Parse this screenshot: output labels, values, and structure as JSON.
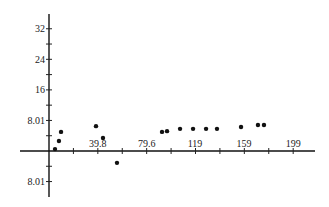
{
  "chart_data": {
    "type": "scatter",
    "title": "",
    "xlabel": "",
    "ylabel": "",
    "x_ticks": [
      39.8,
      79.6,
      119,
      159,
      199
    ],
    "y_ticks": [
      {
        "value": 32,
        "label": "32"
      },
      {
        "value": 24,
        "label": "24"
      },
      {
        "value": 16,
        "label": "16"
      },
      {
        "value": 8.01,
        "label": "8.01"
      },
      {
        "value": -8.01,
        "label": "8.01"
      }
    ],
    "xlim": [
      -23,
      217
    ],
    "ylim": [
      -11,
      36
    ],
    "grid": false,
    "legend": null,
    "series": [
      {
        "name": "points",
        "x": [
          4.9,
          8.1,
          9.8,
          38.3,
          44.0,
          55.4,
          92.1,
          96.2,
          106.8,
          117.4,
          128.0,
          136.9,
          156.5,
          170.3,
          175.2
        ],
        "y": [
          0.5,
          2.6,
          5.0,
          6.5,
          3.4,
          -3.1,
          5.0,
          5.2,
          5.8,
          5.8,
          5.8,
          5.8,
          6.3,
          6.8,
          6.8
        ]
      }
    ]
  },
  "layout": {
    "origin_px": [
      49,
      151
    ],
    "x_px_per_unit": 1.227,
    "y_px_per_unit": 3.82,
    "x_axis_px": [
      20,
      315
    ],
    "y_axis_px": [
      14,
      197
    ],
    "x_minor_ticks": [
      19.9,
      39.8,
      59.7,
      79.6,
      99.5,
      119.4,
      139.3,
      159.2,
      179.1,
      199
    ],
    "y_minor_ticks": [
      -8,
      -4,
      4,
      8,
      12,
      16,
      20,
      24,
      28,
      32
    ]
  }
}
